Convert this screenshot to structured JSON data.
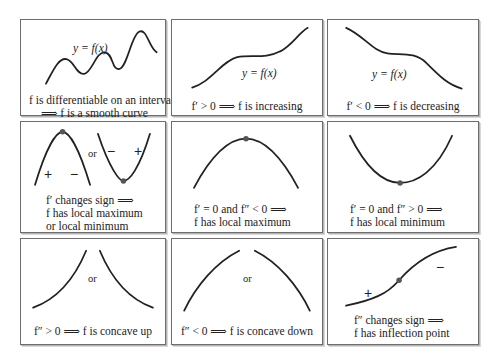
{
  "panels": [
    {
      "id": "smooth",
      "label": "y = f(x)",
      "caption": [
        "f is differentiable on an interval",
        "⟹ f is a smooth curve"
      ]
    },
    {
      "id": "increasing",
      "label": "y = f(x)",
      "caption": [
        "f′ > 0 ⟹ f is increasing"
      ]
    },
    {
      "id": "decreasing",
      "label": "y = f(x)",
      "caption": [
        "f′ < 0 ⟹ f is decreasing"
      ]
    },
    {
      "id": "sign-change",
      "or": "or",
      "signs": [
        "+",
        "−",
        "−",
        "+"
      ],
      "caption": [
        "f′ changes sign ⟹",
        "f has local maximum",
        "or local minimum"
      ]
    },
    {
      "id": "local-max",
      "caption": [
        "f′ = 0 and f″ < 0 ⟹",
        "f has local maximum"
      ]
    },
    {
      "id": "local-min",
      "caption": [
        "f′ = 0 and f″ > 0 ⟹",
        "f has local minimum"
      ]
    },
    {
      "id": "concave-up",
      "or": "or",
      "caption": [
        "f″ > 0 ⟹ f is concave up"
      ]
    },
    {
      "id": "concave-down",
      "or": "or",
      "caption": [
        "f″ < 0 ⟹ f is concave down"
      ]
    },
    {
      "id": "inflection",
      "signs": [
        "+",
        "−"
      ],
      "caption": [
        "f″ changes sign ⟹",
        "f has inflection point"
      ]
    }
  ],
  "colors": {
    "border": "#6d6d6d",
    "curve": "#222222",
    "point": "#555555"
  }
}
